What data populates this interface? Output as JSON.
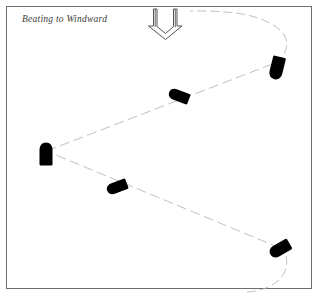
{
  "figure": {
    "caption": "Beating to Windward",
    "background_color": "#ffffff",
    "border_color": "#6e6e6e",
    "path_color": "#b9b9b9",
    "boat_color": "#000000",
    "arrow_color": "#555555",
    "frame": {
      "x": 6,
      "y": 6,
      "width": 306,
      "height": 283
    }
  },
  "wind_arrow": {
    "label": "wind-direction-arrow",
    "direction": "down",
    "style": "hollow-outline-double-shaft",
    "x": 152,
    "y": 8,
    "width": 26,
    "height": 31
  },
  "course_path": {
    "label": "tacking-course",
    "style": "dashed",
    "dash_pattern": "9 4",
    "stroke_width": 0.9,
    "points": [
      {
        "name": "start-bottom-right",
        "x": 258,
        "y": 291
      },
      {
        "name": "curve-to-tack-1",
        "x": 286,
        "y": 264
      },
      {
        "name": "tack-1-bottom-right",
        "x": 281,
        "y": 248
      },
      {
        "name": "leg-2-mid",
        "x": 175,
        "y": 200
      },
      {
        "name": "tack-2-left",
        "x": 46,
        "y": 151
      },
      {
        "name": "leg-3-mid",
        "x": 160,
        "y": 100
      },
      {
        "name": "tack-3-top-right",
        "x": 277,
        "y": 62
      },
      {
        "name": "curve-to-finish",
        "x": 286,
        "y": 42
      },
      {
        "name": "finish-top",
        "x": 190,
        "y": 12
      }
    ]
  },
  "boats": [
    {
      "id": "boat-top-right",
      "label": "boat-at-top-right-tack",
      "x": 277,
      "y": 68,
      "angle": 104,
      "length": 23,
      "width": 13
    },
    {
      "id": "boat-upper-leg",
      "label": "boat-on-upper-port-tack-leg",
      "x": 179,
      "y": 96,
      "angle": 201,
      "length": 21,
      "width": 11
    },
    {
      "id": "boat-left",
      "label": "boat-at-left-tack",
      "x": 46,
      "y": 154,
      "angle": 270,
      "length": 23,
      "width": 13
    },
    {
      "id": "boat-lower-leg",
      "label": "boat-on-lower-starboard-tack-leg",
      "x": 117,
      "y": 187,
      "angle": 159,
      "length": 21,
      "width": 11
    },
    {
      "id": "boat-bottom-right",
      "label": "boat-at-bottom-right-tack",
      "x": 280,
      "y": 249,
      "angle": 150,
      "length": 22,
      "width": 12
    }
  ]
}
